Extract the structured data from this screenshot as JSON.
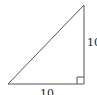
{
  "diagram": {
    "type": "right-triangle",
    "vertices": {
      "bottom_left": [
        8,
        84
      ],
      "bottom_right": [
        84,
        84
      ],
      "top": [
        84,
        5
      ]
    },
    "right_angle_at": "bottom_right",
    "right_angle_marker_size": 7,
    "stroke_color": "#555555",
    "labels": {
      "vertical_side": "10",
      "horizontal_side": "10"
    }
  }
}
